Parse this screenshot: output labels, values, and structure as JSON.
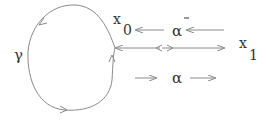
{
  "diagram": {
    "type": "path-homotopy-diagram",
    "colors": {
      "stroke": "#8a8a8a",
      "text": "#333333",
      "background": "#ffffff"
    },
    "labels": {
      "gamma": "γ",
      "x0_base": "x",
      "x0_sub": "0",
      "x1_base": "x",
      "x1_sub": "1",
      "alpha_bar": "α",
      "alpha_bar_accent": "‾",
      "alpha": "α"
    },
    "loop": {
      "name": "gamma",
      "based_at": "x0",
      "orientation": "counterclockwise"
    },
    "paths": [
      {
        "name": "alpha_bar",
        "from": "x1",
        "to": "x0",
        "direction": "left"
      },
      {
        "name": "alpha",
        "from": "x0",
        "to": "x1",
        "direction": "right"
      }
    ]
  }
}
